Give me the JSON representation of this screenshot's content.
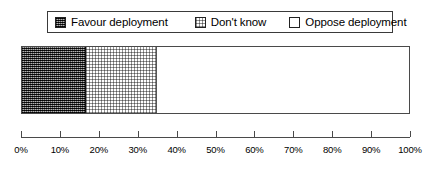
{
  "legend": {
    "items": [
      {
        "label": "Favour deployment",
        "swatch": "dark-crosshatch-swatch-icon",
        "color": "#4a4a4a"
      },
      {
        "label": "Don't know",
        "swatch": "light-stipple-swatch-icon",
        "color": "#ffffff"
      },
      {
        "label": "Oppose deployment",
        "swatch": "empty-swatch-icon",
        "color": "#ffffff"
      }
    ]
  },
  "axis": {
    "ticks": [
      "0%",
      "10%",
      "20%",
      "30%",
      "40%",
      "50%",
      "60%",
      "70%",
      "80%",
      "90%",
      "100%"
    ]
  },
  "chart_data": {
    "type": "bar",
    "orientation": "horizontal",
    "stacked": true,
    "title": "",
    "subtitle": "",
    "xlabel": "",
    "ylabel": "",
    "categories": [
      ""
    ],
    "series": [
      {
        "name": "Favour deployment",
        "values": [
          16.5
        ]
      },
      {
        "name": "Don't know",
        "values": [
          18.5
        ]
      },
      {
        "name": "Oppose deployment",
        "values": [
          65.0
        ]
      }
    ],
    "tick_labels": [
      "0%",
      "10%",
      "20%",
      "30%",
      "40%",
      "50%",
      "60%",
      "70%",
      "80%",
      "90%",
      "100%"
    ],
    "xlim": [
      0,
      100
    ],
    "grid": false,
    "legend_position": "top",
    "annotations": []
  }
}
